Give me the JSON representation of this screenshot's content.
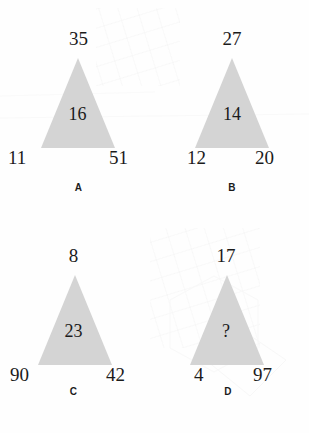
{
  "page": {
    "kind": "visual-number-puzzle",
    "shape": "triangle",
    "background_color": "#fefefe",
    "triangle_fill_color": "#d4d4d4",
    "text_color": "#1b1b1b"
  },
  "puzzle": {
    "items": [
      {
        "label": "A",
        "apex": "35",
        "left": "11",
        "right": "51",
        "center": "16"
      },
      {
        "label": "B",
        "apex": "27",
        "left": "12",
        "right": "20",
        "center": "14"
      },
      {
        "label": "C",
        "apex": "8",
        "left": "90",
        "right": "42",
        "center": "23"
      },
      {
        "label": "D",
        "apex": "17",
        "left": "4",
        "right": "97",
        "center": "?"
      }
    ]
  }
}
